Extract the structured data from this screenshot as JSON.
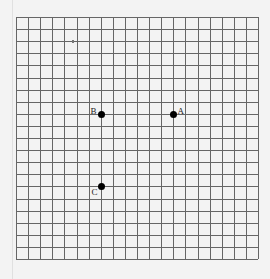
{
  "diagram": {
    "type": "coordinate-grid",
    "grid": {
      "columns": 20,
      "rows": 20,
      "origin_px": [
        16,
        17
      ],
      "cell_px": 12.1,
      "line_color": "#666666",
      "background": "#f3f3f3"
    },
    "points": [
      {
        "label": "A",
        "col": 13,
        "row": 8,
        "label_dx": 4,
        "label_dy": -8
      },
      {
        "label": "B",
        "col": 7,
        "row": 8,
        "label_dx": -11,
        "label_dy": -8
      },
      {
        "label": "C",
        "col": 7,
        "row": 14,
        "label_dx": -10,
        "label_dy": 1
      }
    ],
    "point_color": "#000000"
  }
}
